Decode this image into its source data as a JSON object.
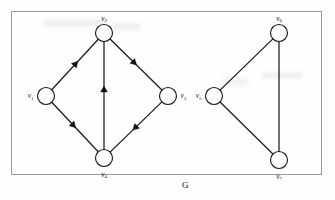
{
  "figure": {
    "caption": "G",
    "border_color": "#9a9a9a",
    "ink_color": "#111111",
    "background": "#fefefe"
  },
  "graph": {
    "name": "G",
    "components": [
      {
        "id": "directed-component",
        "directed": true,
        "vertices": [
          "v2",
          "v1",
          "v3",
          "v4"
        ]
      },
      {
        "id": "undirected-component",
        "directed": false,
        "vertices": [
          "v6",
          "v5",
          "v7"
        ]
      }
    ],
    "nodes": [
      {
        "id": "v2",
        "label": "v",
        "subscript": "2",
        "x": 104,
        "y": 33,
        "r": 8.5,
        "label_pos": "top"
      },
      {
        "id": "v1",
        "label": "v",
        "subscript": "1",
        "x": 46,
        "y": 96,
        "r": 8.5,
        "label_pos": "left"
      },
      {
        "id": "v3",
        "label": "v",
        "subscript": "3",
        "x": 168,
        "y": 96,
        "r": 8.5,
        "label_pos": "right"
      },
      {
        "id": "v4",
        "label": "v",
        "subscript": "4",
        "x": 104,
        "y": 158,
        "r": 8.5,
        "label_pos": "bottom"
      },
      {
        "id": "v6",
        "label": "v",
        "subscript": "6",
        "x": 279,
        "y": 33,
        "r": 8.5,
        "label_pos": "top"
      },
      {
        "id": "v5",
        "label": "v",
        "subscript": "5",
        "x": 214,
        "y": 96,
        "r": 8.5,
        "label_pos": "left"
      },
      {
        "id": "v7",
        "label": "v",
        "subscript": "7",
        "x": 279,
        "y": 160,
        "r": 8.5,
        "label_pos": "bottom"
      }
    ],
    "edges": [
      {
        "id": "e1",
        "from": "v1",
        "to": "v2",
        "directed": true,
        "arrow_at": 0.52
      },
      {
        "id": "e2",
        "from": "v2",
        "to": "v3",
        "directed": true,
        "arrow_at": 0.47
      },
      {
        "id": "e3",
        "from": "v1",
        "to": "v4",
        "directed": true,
        "arrow_at": 0.47
      },
      {
        "id": "e4",
        "from": "v3",
        "to": "v4",
        "directed": true,
        "arrow_at": 0.52
      },
      {
        "id": "e5",
        "from": "v4",
        "to": "v2",
        "directed": true,
        "arrow_at": 0.56
      },
      {
        "id": "e6",
        "from": "v5",
        "to": "v6",
        "directed": false,
        "arrow_at": 0
      },
      {
        "id": "e7",
        "from": "v5",
        "to": "v7",
        "directed": false,
        "arrow_at": 0
      },
      {
        "id": "e8",
        "from": "v6",
        "to": "v7",
        "directed": false,
        "arrow_at": 0
      }
    ]
  },
  "caption_position": {
    "x": 182,
    "y": 180
  }
}
